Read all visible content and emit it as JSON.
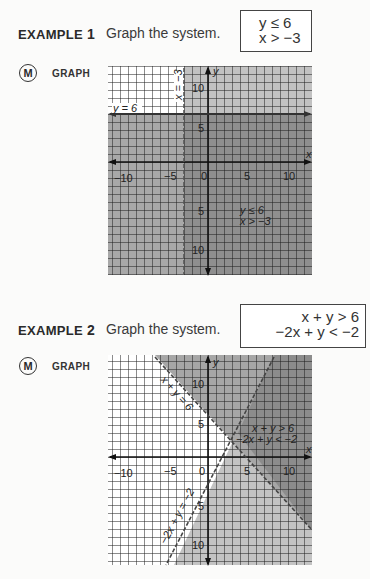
{
  "examples": [
    {
      "label_word": "EXAMPLE",
      "label_number": "1",
      "prompt": "Graph the system.",
      "system": [
        "y ≤ 6",
        "x > −3"
      ],
      "badge": "M",
      "graph_tag": "GRAPH",
      "graph": {
        "x_axis_label": "x",
        "y_axis_label": "y",
        "x_ticks": [
          "−10",
          "−5",
          "0",
          "5",
          "10"
        ],
        "y_ticks_pos": [
          "10",
          "5"
        ],
        "y_ticks_neg": [
          "5",
          "10"
        ],
        "boundary_labels": [
          "y = 6",
          "x = −3"
        ],
        "region_label": [
          "y ≤ 6",
          "x > −3"
        ]
      }
    },
    {
      "label_word": "EXAMPLE",
      "label_number": "2",
      "prompt": "Graph the system.",
      "system": [
        "x + y > 6",
        "−2x + y < −2"
      ],
      "badge": "M",
      "graph_tag": "GRAPH",
      "graph": {
        "x_axis_label": "x",
        "y_axis_label": "y",
        "x_ticks": [
          "−10",
          "−5",
          "0",
          "5",
          "10"
        ],
        "y_ticks_pos": [
          "10",
          "5"
        ],
        "y_ticks_neg": [
          "5",
          "10"
        ],
        "boundary_labels": [
          "x + y = 6",
          "−2x + y = −2"
        ],
        "region_label": [
          "x + y > 6",
          "−2x + y < −2"
        ]
      }
    }
  ],
  "colors": {
    "grid_line": "#1a1a1a",
    "shade_light": "#c9c9c9",
    "shade_mid": "#a9a9a9",
    "shade_dark": "#8e8e8e"
  }
}
